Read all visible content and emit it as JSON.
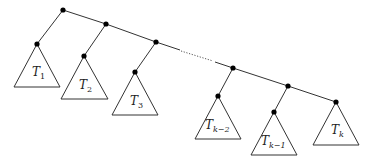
{
  "diagram": {
    "colors": {
      "stroke": "#333333",
      "node": "#000000",
      "background": "#ffffff"
    },
    "ellipsis": "dotted spine segment between T3 and T(k-2)",
    "subtrees": [
      {
        "name": "T",
        "sub": "1"
      },
      {
        "name": "T",
        "sub": "2"
      },
      {
        "name": "T",
        "sub": "3"
      },
      {
        "name": "T",
        "sub": "k−2"
      },
      {
        "name": "T",
        "sub": "k−1"
      },
      {
        "name": "T",
        "sub": "k"
      }
    ]
  }
}
